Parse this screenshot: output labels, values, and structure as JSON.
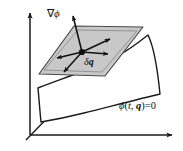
{
  "figure": {
    "background_color": "#ffffff",
    "line_color": "#1a1a1a",
    "plane_fill_color": "#c8c8c8",
    "plane_edge_color": "#555555",
    "surface_fill_color": "#ffffff",
    "width": 183,
    "height": 151
  },
  "labels": {
    "gradient": {
      "nabla": "∇",
      "phi": "ϕ",
      "full": "∇ϕ"
    },
    "virtual_displacement": {
      "delta": "δ",
      "q": "q",
      "full": "δq"
    },
    "constraint_equation": {
      "phi": "ϕ",
      "open_paren": "(",
      "t": "t",
      "comma": ", ",
      "q": "q",
      "close_paren": ")",
      "equals": "=",
      "zero": "0",
      "full": "ϕ(t, q) = 0"
    }
  },
  "axes": {
    "origin": {
      "x": 30,
      "y": 135
    },
    "vertical": {
      "x1": 30,
      "y1": 135,
      "x2": 30,
      "y2": 10
    },
    "horizontal": {
      "x1": 30,
      "y1": 135,
      "x2": 176,
      "y2": 135
    },
    "diagonal": {
      "x1": 30,
      "y1": 135,
      "x2": 85,
      "y2": 79
    }
  },
  "tangent_plane": {
    "vertices": [
      {
        "x": 74,
        "y": 26
      },
      {
        "x": 143,
        "y": 27
      },
      {
        "x": 105,
        "y": 76
      },
      {
        "x": 39,
        "y": 74
      }
    ],
    "center_point": {
      "x": 82,
      "y": 52
    }
  },
  "gradient_arrow": {
    "from": {
      "x": 82,
      "y": 52
    },
    "to": {
      "x": 72,
      "y": 12
    }
  },
  "displacement_arrows": [
    {
      "name": "arrow-up-right",
      "from": {
        "x": 82,
        "y": 52
      },
      "to": {
        "x": 113,
        "y": 38
      }
    },
    {
      "name": "arrow-right",
      "from": {
        "x": 82,
        "y": 52
      },
      "to": {
        "x": 111,
        "y": 54
      }
    },
    {
      "name": "arrow-left",
      "from": {
        "x": 82,
        "y": 52
      },
      "to": {
        "x": 54,
        "y": 59
      }
    },
    {
      "name": "arrow-down-left",
      "from": {
        "x": 82,
        "y": 52
      },
      "to": {
        "x": 62,
        "y": 74
      }
    }
  ],
  "constraint_surface": {
    "description": "curved white surface below and right of the tangent plane"
  }
}
